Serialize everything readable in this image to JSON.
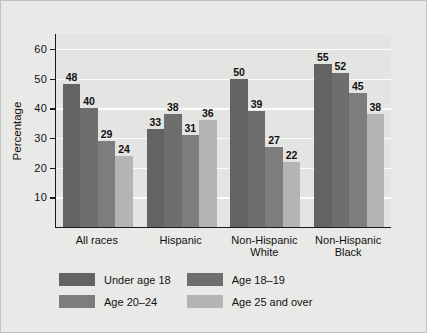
{
  "chart_data": {
    "type": "bar",
    "title": "",
    "xlabel": "",
    "ylabel": "Percentage",
    "ylim": [
      0,
      65
    ],
    "yticks": [
      10,
      20,
      30,
      40,
      50,
      60
    ],
    "grid": true,
    "legend_position": "bottom-left",
    "categories": [
      "All races",
      "Hispanic",
      "Non-Hispanic White",
      "Non-Hispanic Black"
    ],
    "series": [
      {
        "name": "Under age 18",
        "color": "#636363",
        "values": [
          48,
          33,
          50,
          55
        ]
      },
      {
        "name": "Age 18–19",
        "color": "#6e6e6e",
        "values": [
          40,
          38,
          39,
          52
        ]
      },
      {
        "name": "Age 20–24",
        "color": "#7d7d7d",
        "values": [
          29,
          31,
          27,
          45
        ]
      },
      {
        "name": "Age 25 and over",
        "color": "#b4b4b4",
        "values": [
          24,
          36,
          22,
          38
        ]
      }
    ]
  },
  "category_lines": [
    [
      "All races"
    ],
    [
      "Hispanic"
    ],
    [
      "Non-Hispanic",
      "White"
    ],
    [
      "Non-Hispanic",
      "Black"
    ]
  ],
  "colors": {
    "figure_background": "#e9e9e7",
    "plot_background": "#e4e4e2",
    "gridline": "#fbfbfa",
    "axis": "#1a1a1a",
    "text": "#111111"
  }
}
